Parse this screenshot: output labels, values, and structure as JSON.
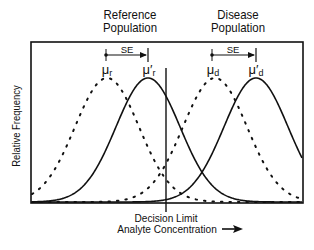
{
  "diagram": {
    "type": "overlapping-normal-distributions",
    "populations": [
      {
        "label_line1": "Reference",
        "label_line2": "Population",
        "mean_label": "μ",
        "mean_sub": "r",
        "shifted_mean_label": "μ′",
        "shifted_mean_sub": "r",
        "shift_label": "SE"
      },
      {
        "label_line1": "Disease",
        "label_line2": "Population",
        "mean_label": "μ",
        "mean_sub": "d",
        "shifted_mean_label": "μ′",
        "shifted_mean_sub": "d",
        "shift_label": "SE"
      }
    ],
    "y_axis_label": "Relative Frequency",
    "decision_label": "Decision Limit",
    "x_axis_label": "Analyte Concentration",
    "x_axis_arrow": "→",
    "curves": [
      {
        "name": "reference-original",
        "style": "dotted",
        "peak_x": 107
      },
      {
        "name": "reference-shifted",
        "style": "solid",
        "peak_x": 148
      },
      {
        "name": "disease-original",
        "style": "dotted",
        "peak_x": 215
      },
      {
        "name": "disease-shifted",
        "style": "solid",
        "peak_x": 256
      }
    ],
    "line_color": "#111111",
    "background": "#ffffff"
  }
}
